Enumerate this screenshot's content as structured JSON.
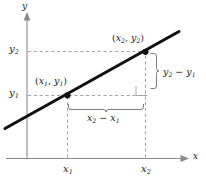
{
  "figure": {
    "kind": "slope-of-a-line-diagram",
    "background": "#ffffff",
    "ink": "#1a1a1a",
    "guide_color": "#9a9a9a",
    "axis_color": "#8a8a8a"
  },
  "axes": {
    "x_axis_label": "x",
    "y_axis_label": "y",
    "x_ticks": [
      {
        "id": "x1",
        "base": "x",
        "sub": "1"
      },
      {
        "id": "x2",
        "base": "x",
        "sub": "2"
      }
    ],
    "y_ticks": [
      {
        "id": "y1",
        "base": "y",
        "sub": "1"
      },
      {
        "id": "y2",
        "base": "y",
        "sub": "2"
      }
    ]
  },
  "points": [
    {
      "id": "point-1",
      "label_open": "(",
      "label_x_base": "x",
      "label_x_sub": "1",
      "label_sep": ",",
      "label_y_base": "y",
      "label_y_sub": "1",
      "label_close": ")"
    },
    {
      "id": "point-2",
      "label_open": "(",
      "label_x_base": "x",
      "label_x_sub": "2",
      "label_sep": ",",
      "label_y_base": "y",
      "label_y_sub": "2",
      "label_close": ")"
    }
  ],
  "annotations": {
    "rise": {
      "base_a": "y",
      "sub_a": "2",
      "operator": "−",
      "base_b": "y",
      "sub_b": "1",
      "position": "right"
    },
    "run": {
      "base_a": "x",
      "sub_a": "2",
      "operator": "−",
      "base_b": "x",
      "sub_b": "1",
      "position": "below"
    },
    "right_angle_marker": "right-angle-square"
  }
}
